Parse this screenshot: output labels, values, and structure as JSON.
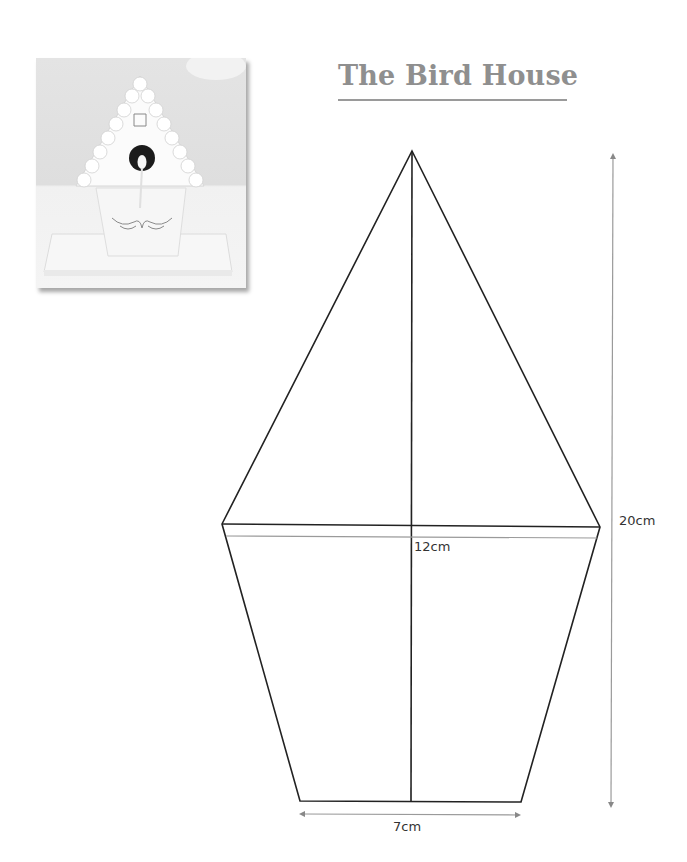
{
  "title": "The Bird House",
  "photo": {
    "alt": "White iced gingerbread bird house with scalloped roof, dark round opening with bird figure, on a white base"
  },
  "template": {
    "shape": "pentagon-birdhouse-front",
    "line_color": "#222222",
    "dimension_line_color": "#999999",
    "dimensions": {
      "width_at_eaves": "12cm",
      "width_at_base": "7cm",
      "total_height": "20cm"
    }
  }
}
